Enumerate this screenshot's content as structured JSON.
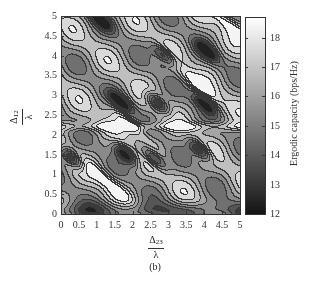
{
  "chart_data": {
    "type": "heatmap",
    "subtype": "filled-contour",
    "title": "",
    "panel_label": "(b)",
    "xlabel": {
      "numerator": "Δ",
      "subscript": "23",
      "denominator": "λ"
    },
    "ylabel": {
      "numerator": "Δ",
      "subscript": "12",
      "denominator": "λ"
    },
    "xlim": [
      0,
      5
    ],
    "ylim": [
      0,
      5
    ],
    "xticks": [
      "0",
      "0.5",
      "1",
      "1.5",
      "2",
      "2.5",
      "3",
      "3.5",
      "4",
      "4.5",
      "5"
    ],
    "yticks": [
      "0",
      "0.5",
      "1",
      "1.5",
      "2",
      "2.5",
      "3",
      "3.5",
      "4",
      "4.5",
      "5"
    ],
    "colorbar": {
      "label": "Ergodic capacity (bps/Hz)",
      "ticks": [
        "12",
        "13",
        "14",
        "15",
        "16",
        "17",
        "18"
      ],
      "range": [
        12,
        18.7
      ],
      "colormap": "gray (dark = low, white = high)"
    },
    "grid": false,
    "notable_minima": [
      {
        "x": 1.7,
        "y": 2.8,
        "approx": 12.5
      },
      {
        "x": 2.7,
        "y": 2.8,
        "approx": 12.5
      },
      {
        "x": 4.0,
        "y": 2.8,
        "approx": 13
      },
      {
        "x": 2.9,
        "y": 4.0,
        "approx": 12.5
      },
      {
        "x": 4.1,
        "y": 4.1,
        "approx": 13
      },
      {
        "x": 1.8,
        "y": 1.5,
        "approx": 12.5
      },
      {
        "x": 2.6,
        "y": 1.4,
        "approx": 12.5
      },
      {
        "x": 3.9,
        "y": 1.6,
        "approx": 12.5
      },
      {
        "x": 0.3,
        "y": 1.4,
        "approx": 13
      },
      {
        "x": 1.1,
        "y": 4.9,
        "approx": 13
      }
    ],
    "notable_maxima": [
      {
        "x": 2.0,
        "y": 2.2,
        "approx": 18.5
      },
      {
        "x": 1.3,
        "y": 0.8,
        "approx": 18.5
      },
      {
        "x": 3.8,
        "y": 3.3,
        "approx": 18
      },
      {
        "x": 4.7,
        "y": 4.8,
        "approx": 18
      }
    ]
  }
}
